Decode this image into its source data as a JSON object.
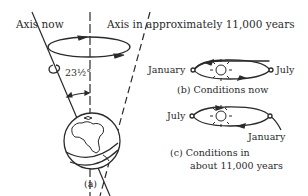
{
  "panel_a": {
    "axis_now_label": "Axis now",
    "axis_future_label": "Axis in approximately 11,000 years",
    "tilt_angle_label": "23½°",
    "caption": "(a)"
  },
  "panel_b": {
    "january_label": "January",
    "july_label": "July",
    "caption": "(b)  Conditions now"
  },
  "panel_c": {
    "july_label": "July",
    "january_label": "January",
    "caption_line1": "(c)  Conditions in",
    "caption_line2": "about 11,000 years"
  }
}
